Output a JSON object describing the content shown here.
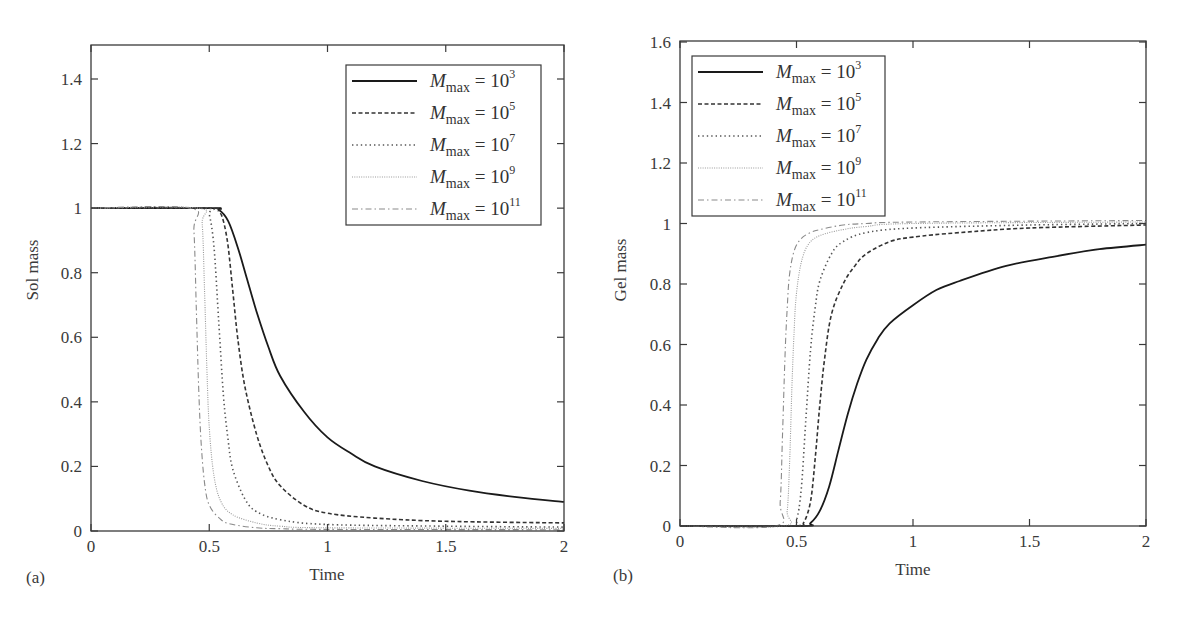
{
  "figure": {
    "panels": [
      {
        "tag": "(a)",
        "xlabel": "Time",
        "ylabel": "Sol mass"
      },
      {
        "tag": "(b)",
        "xlabel": "Time",
        "ylabel": "Gel mass"
      }
    ]
  },
  "legend": {
    "symbol": "M",
    "subscript": "max",
    "entries": [
      {
        "exp": "3",
        "style": "solid",
        "color": "#1a1a1a"
      },
      {
        "exp": "5",
        "style": "dashed",
        "color": "#333333"
      },
      {
        "exp": "7",
        "style": "dotted",
        "color": "#555555"
      },
      {
        "exp": "9",
        "style": "finedot",
        "color": "#9a9a9a"
      },
      {
        "exp": "11",
        "style": "dashdot",
        "color": "#8a8a8a"
      }
    ]
  },
  "chart_data": [
    {
      "type": "line",
      "title": "",
      "panel": "(a)",
      "xlabel": "Time",
      "ylabel": "Sol mass",
      "xlim": [
        0,
        2
      ],
      "ylim": [
        0,
        1.5
      ],
      "xticks": [
        0,
        0.5,
        1,
        1.5,
        2
      ],
      "xtick_labels": [
        "0",
        "0.5",
        "1",
        "1.5",
        "2"
      ],
      "yticks": [
        0,
        0.2,
        0.4,
        0.6,
        0.8,
        1,
        1.2,
        1.4
      ],
      "ytick_labels": [
        "0",
        "0.2",
        "0.4",
        "0.6",
        "0.8",
        "1",
        "1.2",
        "1.4"
      ],
      "grid": false,
      "legend_position": "upper right",
      "series": [
        {
          "name": "M_max = 10^3",
          "x": [
            0,
            0.5,
            0.54,
            0.58,
            0.62,
            0.66,
            0.7,
            0.75,
            0.8,
            0.9,
            1.0,
            1.1,
            1.2,
            1.4,
            1.6,
            1.8,
            2.0
          ],
          "y": [
            1,
            1,
            0.995,
            0.96,
            0.88,
            0.78,
            0.68,
            0.57,
            0.48,
            0.37,
            0.29,
            0.24,
            0.2,
            0.155,
            0.125,
            0.105,
            0.09
          ]
        },
        {
          "name": "M_max = 10^5",
          "x": [
            0,
            0.5,
            0.54,
            0.56,
            0.58,
            0.6,
            0.62,
            0.65,
            0.7,
            0.75,
            0.8,
            0.9,
            1.0,
            1.2,
            1.5,
            2.0
          ],
          "y": [
            1,
            1,
            0.99,
            0.96,
            0.88,
            0.74,
            0.6,
            0.45,
            0.3,
            0.2,
            0.14,
            0.08,
            0.055,
            0.04,
            0.03,
            0.025
          ]
        },
        {
          "name": "M_max = 10^7",
          "x": [
            0,
            0.48,
            0.5,
            0.52,
            0.54,
            0.56,
            0.58,
            0.6,
            0.65,
            0.7,
            0.8,
            1.0,
            1.5,
            2.0
          ],
          "y": [
            1,
            1,
            0.98,
            0.88,
            0.65,
            0.42,
            0.28,
            0.19,
            0.1,
            0.06,
            0.035,
            0.02,
            0.015,
            0.012
          ]
        },
        {
          "name": "M_max = 10^9",
          "x": [
            0,
            0.45,
            0.47,
            0.48,
            0.49,
            0.5,
            0.52,
            0.55,
            0.6,
            0.7,
            0.8,
            1.0,
            2.0
          ],
          "y": [
            1,
            1,
            0.95,
            0.75,
            0.5,
            0.32,
            0.17,
            0.09,
            0.05,
            0.025,
            0.015,
            0.01,
            0.008
          ]
        },
        {
          "name": "M_max = 10^11",
          "x": [
            0,
            0.42,
            0.435,
            0.445,
            0.455,
            0.465,
            0.48,
            0.5,
            0.55,
            0.6,
            0.7,
            0.8,
            1.0,
            2.0
          ],
          "y": [
            1,
            1,
            0.93,
            0.7,
            0.45,
            0.28,
            0.15,
            0.08,
            0.035,
            0.02,
            0.01,
            0.007,
            0.005,
            0.004
          ]
        }
      ]
    },
    {
      "type": "line",
      "title": "",
      "panel": "(b)",
      "xlabel": "Time",
      "ylabel": "Gel mass",
      "xlim": [
        0,
        2
      ],
      "ylim": [
        0,
        1.6
      ],
      "xticks": [
        0,
        0.5,
        1,
        1.5,
        2
      ],
      "xtick_labels": [
        "0",
        "0.5",
        "1",
        "1.5",
        "2"
      ],
      "yticks": [
        0,
        0.2,
        0.4,
        0.6,
        0.8,
        1,
        1.2,
        1.4,
        1.6
      ],
      "ytick_labels": [
        "0",
        "0.2",
        "0.4",
        "0.6",
        "0.8",
        "1",
        "1.2",
        "1.4",
        "1.6"
      ],
      "grid": false,
      "legend_position": "upper left",
      "series": [
        {
          "name": "M_max = 10^3",
          "x": [
            0,
            0.52,
            0.56,
            0.6,
            0.64,
            0.68,
            0.72,
            0.76,
            0.8,
            0.85,
            0.9,
            1.0,
            1.1,
            1.2,
            1.4,
            1.6,
            1.8,
            2.0
          ],
          "y": [
            0,
            0,
            0.01,
            0.05,
            0.13,
            0.25,
            0.37,
            0.47,
            0.55,
            0.62,
            0.67,
            0.73,
            0.78,
            0.81,
            0.86,
            0.89,
            0.915,
            0.93
          ]
        },
        {
          "name": "M_max = 10^5",
          "x": [
            0,
            0.5,
            0.53,
            0.56,
            0.58,
            0.6,
            0.62,
            0.65,
            0.7,
            0.75,
            0.8,
            0.9,
            1.0,
            1.2,
            1.5,
            2.0
          ],
          "y": [
            0,
            0,
            0.01,
            0.08,
            0.22,
            0.4,
            0.55,
            0.7,
            0.8,
            0.86,
            0.9,
            0.94,
            0.955,
            0.97,
            0.985,
            0.995
          ]
        },
        {
          "name": "M_max = 10^7",
          "x": [
            0,
            0.47,
            0.5,
            0.52,
            0.54,
            0.56,
            0.58,
            0.6,
            0.65,
            0.7,
            0.8,
            1.0,
            1.5,
            2.0
          ],
          "y": [
            0,
            0,
            0.02,
            0.12,
            0.35,
            0.58,
            0.72,
            0.81,
            0.9,
            0.94,
            0.97,
            0.985,
            0.995,
            1.0
          ]
        },
        {
          "name": "M_max = 10^9",
          "x": [
            0,
            0.44,
            0.46,
            0.47,
            0.48,
            0.49,
            0.5,
            0.52,
            0.55,
            0.6,
            0.7,
            0.8,
            1.0,
            2.0
          ],
          "y": [
            0,
            0,
            0.05,
            0.2,
            0.45,
            0.65,
            0.77,
            0.87,
            0.93,
            0.96,
            0.98,
            0.99,
            1.0,
            1.005
          ]
        },
        {
          "name": "M_max = 10^11",
          "x": [
            0,
            0.41,
            0.43,
            0.44,
            0.45,
            0.46,
            0.47,
            0.49,
            0.52,
            0.56,
            0.6,
            0.7,
            0.8,
            1.0,
            2.0
          ],
          "y": [
            0,
            0,
            0.08,
            0.3,
            0.55,
            0.72,
            0.83,
            0.91,
            0.95,
            0.97,
            0.98,
            0.995,
            1.0,
            1.005,
            1.01
          ]
        }
      ]
    }
  ]
}
